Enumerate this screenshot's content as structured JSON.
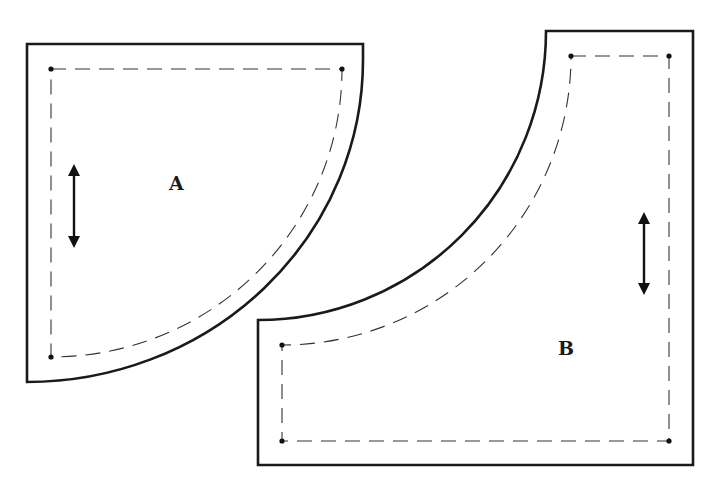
{
  "diagram": {
    "type": "sewing-pattern-pieces",
    "colors": {
      "background": "#ffffff",
      "cut_line": "#1a1a1a",
      "seam_line": "#333333",
      "marker": "#111111"
    },
    "pieces": [
      {
        "id": "A",
        "label": "A",
        "shape": "quarter-circle (convex curve)",
        "grainline": "vertical double-headed arrow",
        "seam_corner_dots": 3
      },
      {
        "id": "B",
        "label": "B",
        "shape": "square with concave quarter-circle cutout",
        "grainline": "vertical double-headed arrow",
        "seam_corner_dots": 4
      }
    ],
    "legend": {
      "solid_line": "cutting line",
      "dashed_line": "seam line",
      "arrow": "grainline"
    }
  }
}
